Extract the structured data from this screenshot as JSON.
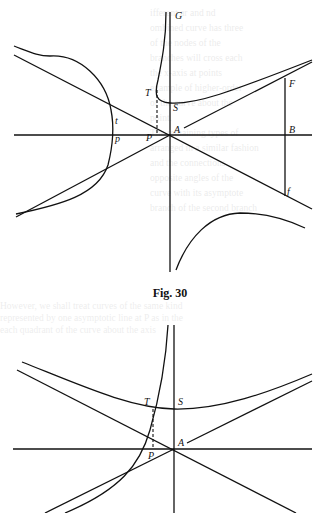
{
  "figures": [
    {
      "caption": "Fig. 30",
      "labels": {
        "G": "G",
        "T": "T",
        "S": "S",
        "F": "F",
        "t": "t",
        "p": "p",
        "P": "P",
        "A": "A",
        "B": "B",
        "f": "f"
      }
    },
    {
      "caption": "",
      "labels": {
        "T": "T",
        "S": "S",
        "A": "A",
        "P": "P"
      }
    }
  ],
  "bleed_through_text": [
    "ifferent ar and nd",
    "ombined curve has three",
    "of the nodes of the",
    "branches will cross each",
    "the x-axis at points",
    "example of higher-order",
    "of the curve about the",
    "point.",
    "The remaining types of",
    "arranged in a similar fashion",
    "and the connections",
    "opposite angles of the",
    "curve with its asymptote",
    "branch of the second branch"
  ],
  "bleed_through_text_lower": [
    "However, we shall treat curves of the same kind",
    "represented by one asymptotic line at P as in the",
    "each quadrant of the curve about the axis"
  ]
}
